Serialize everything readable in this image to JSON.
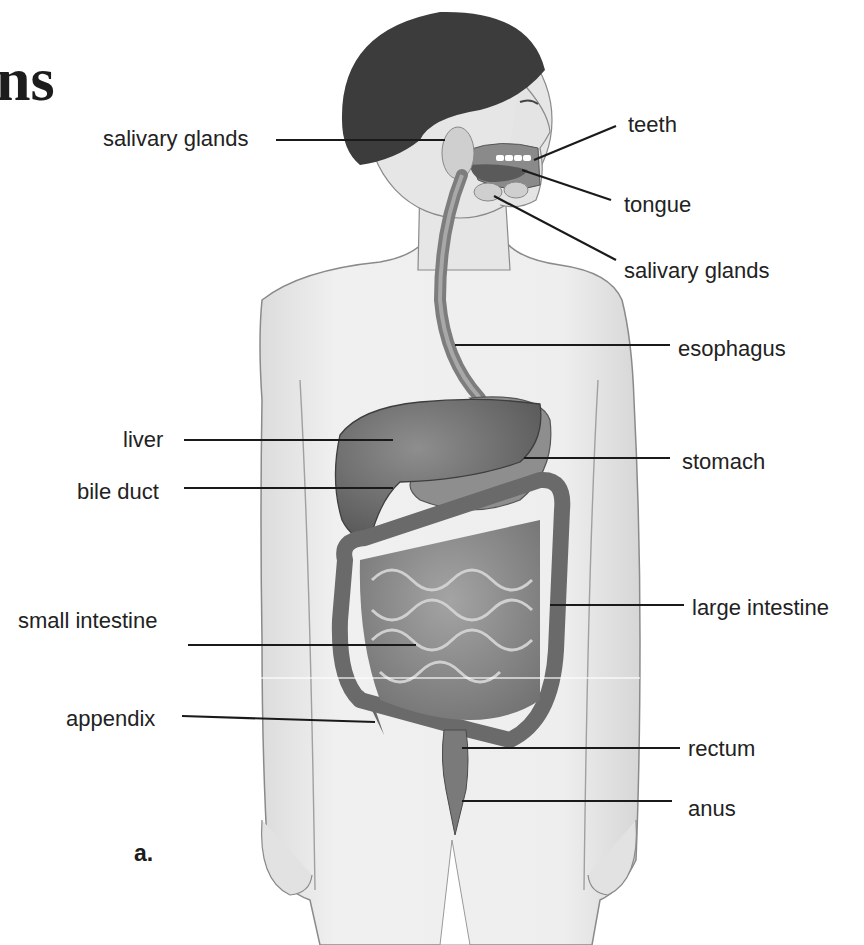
{
  "title_fragment": "ns",
  "panel_letter": "a.",
  "diagram": {
    "labels": [
      {
        "id": "salivary-glands-left",
        "text": "salivary glands",
        "x": 103,
        "y": 128,
        "align": "right",
        "line": [
          276,
          140,
          445,
          140
        ]
      },
      {
        "id": "teeth",
        "text": "teeth",
        "x": 628,
        "y": 114,
        "align": "left",
        "line": [
          616,
          126,
          534,
          160
        ]
      },
      {
        "id": "tongue",
        "text": "tongue",
        "x": 624,
        "y": 194,
        "align": "left",
        "line": [
          611,
          200,
          522,
          170
        ]
      },
      {
        "id": "salivary-glands-right",
        "text": "salivary glands",
        "x": 624,
        "y": 260,
        "align": "left",
        "line": [
          616,
          260,
          494,
          196
        ]
      },
      {
        "id": "esophagus",
        "text": "esophagus",
        "x": 678,
        "y": 338,
        "align": "left",
        "line": [
          670,
          345,
          455,
          345
        ]
      },
      {
        "id": "liver",
        "text": "liver",
        "x": 123,
        "y": 429,
        "align": "right",
        "line": [
          184,
          440,
          393,
          440
        ]
      },
      {
        "id": "stomach",
        "text": "stomach",
        "x": 682,
        "y": 451,
        "align": "left",
        "line": [
          670,
          458,
          524,
          458
        ]
      },
      {
        "id": "bile-duct",
        "text": "bile duct",
        "x": 77,
        "y": 481,
        "align": "right",
        "line": [
          184,
          488,
          393,
          488
        ]
      },
      {
        "id": "large-intestine",
        "text": "large intestine",
        "x": 692,
        "y": 597,
        "align": "left",
        "line": [
          684,
          605,
          550,
          605
        ]
      },
      {
        "id": "small-intestine",
        "text": "small intestine",
        "x": 18,
        "y": 610,
        "align": "right",
        "line": [
          188,
          645,
          416,
          645
        ]
      },
      {
        "id": "appendix",
        "text": "appendix",
        "x": 66,
        "y": 708,
        "align": "right",
        "line": [
          182,
          716,
          375,
          722
        ]
      },
      {
        "id": "rectum",
        "text": "rectum",
        "x": 688,
        "y": 738,
        "align": "left",
        "line": [
          680,
          748,
          462,
          748
        ]
      },
      {
        "id": "anus",
        "text": "anus",
        "x": 688,
        "y": 798,
        "align": "left",
        "line": [
          672,
          801,
          462,
          801
        ]
      }
    ]
  },
  "colors": {
    "background": "#ffffff",
    "text": "#222222",
    "leader_line": "#1a1a1a",
    "skin": "#ececec",
    "skin_outline": "#8a8a8a",
    "hair": "#3c3c3c",
    "organ_dark": "#6a6a6a",
    "organ_mid": "#8c8c8c",
    "organ_light": "#a9a9a9"
  }
}
